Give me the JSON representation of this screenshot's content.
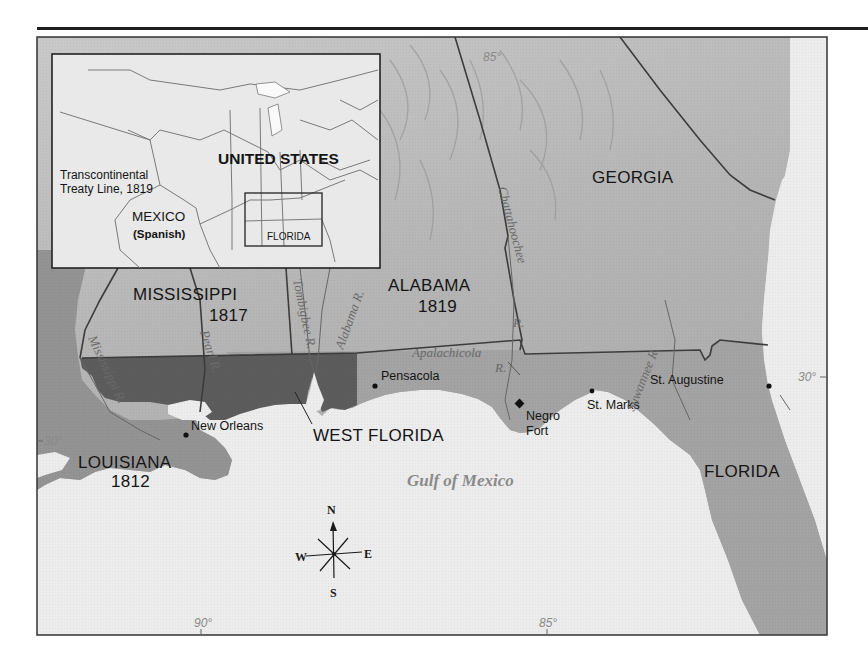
{
  "map": {
    "inset": {
      "title": "UNITED STATES",
      "treaty_line_label_1": "Transcontinental",
      "treaty_line_label_2": "Treaty Line, 1819",
      "mexico_label": "MEXICO",
      "mexico_sub": "(Spanish)",
      "florida_label": "FLORIDA"
    },
    "states": {
      "georgia": "GEORGIA",
      "alabama": "ALABAMA",
      "alabama_year": "1819",
      "mississippi": "MISSISSIPPI",
      "mississippi_year": "1817",
      "louisiana": "LOUISIANA",
      "louisiana_year": "1812",
      "west_florida": "WEST FLORIDA",
      "florida": "FLORIDA"
    },
    "cities": {
      "pensacola": "Pensacola",
      "new_orleans": "New Orleans",
      "negro_fort_1": "Negro",
      "negro_fort_2": "Fort",
      "st_marks": "St. Marks",
      "st_augustine": "St. Augustine"
    },
    "rivers": {
      "chattahoochee": "Chattahoochee",
      "chattahoochee_r": "R.",
      "apalachicola": "Apalachicola",
      "apalachicola_r": "R.",
      "tombigbee": "Tombigbee R.",
      "alabama": "Alabama R.",
      "pearl": "Pearl R.",
      "mississippi": "Mississippi R.",
      "suwannee": "Suwannee R."
    },
    "water": {
      "gulf": "Gulf of Mexico"
    },
    "graticule": {
      "lon_85_top": "85°",
      "lon_90_bottom": "90°",
      "lon_85_bottom": "85°",
      "lat_30_left": "30°",
      "lat_30_right": "30°"
    },
    "compass": {
      "n": "N",
      "s": "S",
      "e": "E",
      "w": "W"
    },
    "colors": {
      "water": "#ececec",
      "land_us": "#a8a8a8",
      "terrain_light": "#c4c4c4",
      "spanish_florida": "#9d9d9d",
      "west_florida_disputed": "#5e5e5e",
      "louisiana": "#8f8f8f",
      "border": "#3c3c3c"
    }
  }
}
